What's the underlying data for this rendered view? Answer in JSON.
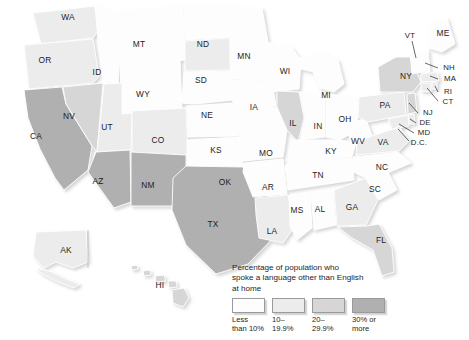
{
  "map": {
    "title": "Percentage of population who spoke a language other than English at home",
    "projection_note": "United States choropleth with Alaska and Hawaii insets",
    "background_color": "#ffffff",
    "border_color": "#ffffff",
    "label_color": "#1d1d1d"
  },
  "legend": {
    "title_line_1": "Percentage of population who",
    "title_line_2": "spoke a language other than English",
    "title_line_3": "at home",
    "title_text": "Percentage of population who\nspoke a language other than English\nat home",
    "items": [
      {
        "label_line_1": "Less",
        "label_line_2": "than 10%",
        "label": "Less\nthan 10%",
        "color": "#fdfdfd"
      },
      {
        "label_line_1": "10–",
        "label_line_2": "19.9%",
        "label": "10–\n19.9%",
        "color": "#ececec"
      },
      {
        "label_line_1": "20–",
        "label_line_2": "29.9%",
        "label": "20–\n29.9%",
        "color": "#d6d6d6"
      },
      {
        "label_line_1": "30% or",
        "label_line_2": "more",
        "label": "30% or\nmore",
        "color": "#b0b0b0"
      }
    ]
  },
  "chart_data": {
    "type": "map",
    "title": "Percentage of population who spoke a language other than English at home",
    "classes": [
      "Less than 10%",
      "10–19.9%",
      "20–29.9%",
      "30% or more"
    ],
    "class_colors": [
      "#fdfdfd",
      "#ececec",
      "#d6d6d6",
      "#b0b0b0"
    ],
    "states": [
      {
        "code": "WA",
        "class": "10–19.9%",
        "color": "#ececec",
        "label_x": 68,
        "label_y": 18
      },
      {
        "code": "OR",
        "class": "10–19.9%",
        "color": "#ececec",
        "label_x": 45,
        "label_y": 61
      },
      {
        "code": "CA",
        "class": "30% or more",
        "color": "#b0b0b0",
        "label_x": 36,
        "label_y": 137
      },
      {
        "code": "NV",
        "class": "20–29.9%",
        "color": "#d6d6d6",
        "label_x": 69,
        "label_y": 117
      },
      {
        "code": "ID",
        "class": "Less than 10%",
        "color": "#fdfdfd",
        "label_x": 97,
        "label_y": 73
      },
      {
        "code": "MT",
        "class": "Less than 10%",
        "color": "#fdfdfd",
        "label_x": 139,
        "label_y": 45
      },
      {
        "code": "WY",
        "class": "Less than 10%",
        "color": "#fdfdfd",
        "label_x": 143,
        "label_y": 95
      },
      {
        "code": "UT",
        "class": "10–19.9%",
        "color": "#ececec",
        "label_x": 107,
        "label_y": 128
      },
      {
        "code": "AZ",
        "class": "30% or more",
        "color": "#b0b0b0",
        "label_x": 98,
        "label_y": 182
      },
      {
        "code": "NM",
        "class": "30% or more",
        "color": "#b0b0b0",
        "label_x": 148,
        "label_y": 186
      },
      {
        "code": "CO",
        "class": "10–19.9%",
        "color": "#ececec",
        "label_x": 158,
        "label_y": 141
      },
      {
        "code": "ND",
        "class": "Less than 10%",
        "color": "#fdfdfd",
        "label_x": 203,
        "label_y": 45
      },
      {
        "code": "SD",
        "class": "10–19.9%",
        "color": "#ececec",
        "label_x": 201,
        "label_y": 81
      },
      {
        "code": "NE",
        "class": "Less than 10%",
        "color": "#fdfdfd",
        "label_x": 207,
        "label_y": 116
      },
      {
        "code": "KS",
        "class": "Less than 10%",
        "color": "#fdfdfd",
        "label_x": 216,
        "label_y": 151
      },
      {
        "code": "OK",
        "class": "Less than 10%",
        "color": "#fdfdfd",
        "label_x": 225,
        "label_y": 183
      },
      {
        "code": "TX",
        "class": "30% or more",
        "color": "#b0b0b0",
        "label_x": 213,
        "label_y": 225
      },
      {
        "code": "MN",
        "class": "Less than 10%",
        "color": "#fdfdfd",
        "label_x": 244,
        "label_y": 57
      },
      {
        "code": "IA",
        "class": "Less than 10%",
        "color": "#fdfdfd",
        "label_x": 254,
        "label_y": 108
      },
      {
        "code": "MO",
        "class": "Less than 10%",
        "color": "#fdfdfd",
        "label_x": 266,
        "label_y": 154
      },
      {
        "code": "AR",
        "class": "Less than 10%",
        "color": "#fdfdfd",
        "label_x": 268,
        "label_y": 188
      },
      {
        "code": "LA",
        "class": "10–19.9%",
        "color": "#ececec",
        "label_x": 272,
        "label_y": 232
      },
      {
        "code": "WI",
        "class": "Less than 10%",
        "color": "#fdfdfd",
        "label_x": 285,
        "label_y": 72
      },
      {
        "code": "IL",
        "class": "20–29.9%",
        "color": "#d6d6d6",
        "label_x": 293,
        "label_y": 124
      },
      {
        "code": "MS",
        "class": "Less than 10%",
        "color": "#fdfdfd",
        "label_x": 297,
        "label_y": 211
      },
      {
        "code": "AL",
        "class": "Less than 10%",
        "color": "#fdfdfd",
        "label_x": 320,
        "label_y": 210
      },
      {
        "code": "TN",
        "class": "Less than 10%",
        "color": "#fdfdfd",
        "label_x": 318,
        "label_y": 176
      },
      {
        "code": "KY",
        "class": "Less than 10%",
        "color": "#fdfdfd",
        "label_x": 331,
        "label_y": 152
      },
      {
        "code": "IN",
        "class": "Less than 10%",
        "color": "#fdfdfd",
        "label_x": 318,
        "label_y": 127
      },
      {
        "code": "OH",
        "class": "Less than 10%",
        "color": "#fdfdfd",
        "label_x": 345,
        "label_y": 120
      },
      {
        "code": "MI",
        "class": "Less than 10%",
        "color": "#fdfdfd",
        "label_x": 326,
        "label_y": 96
      },
      {
        "code": "GA",
        "class": "10–19.9%",
        "color": "#ececec",
        "label_x": 352,
        "label_y": 208
      },
      {
        "code": "FL",
        "class": "20–29.9%",
        "color": "#d6d6d6",
        "label_x": 381,
        "label_y": 241
      },
      {
        "code": "SC",
        "class": "Less than 10%",
        "color": "#fdfdfd",
        "label_x": 375,
        "label_y": 190
      },
      {
        "code": "NC",
        "class": "Less than 10%",
        "color": "#fdfdfd",
        "label_x": 382,
        "label_y": 168
      },
      {
        "code": "WV",
        "class": "Less than 10%",
        "color": "#fdfdfd",
        "label_x": 358,
        "label_y": 142
      },
      {
        "code": "VA",
        "class": "10–19.9%",
        "color": "#ececec",
        "label_x": 383,
        "label_y": 143
      },
      {
        "code": "PA",
        "class": "10–19.9%",
        "color": "#ececec",
        "label_x": 385,
        "label_y": 106
      },
      {
        "code": "NY",
        "class": "20–29.9%",
        "color": "#d6d6d6",
        "label_x": 406,
        "label_y": 77
      },
      {
        "code": "VT",
        "class": "Less than 10%",
        "color": "#fdfdfd",
        "label_x": 410,
        "label_y": 36
      },
      {
        "code": "ME",
        "class": "Less than 10%",
        "color": "#fdfdfd",
        "label_x": 443,
        "label_y": 34
      },
      {
        "code": "NH",
        "class": "Less than 10%",
        "color": "#fdfdfd",
        "label_x": 449,
        "label_y": 68
      },
      {
        "code": "MA",
        "class": "10–19.9%",
        "color": "#ececec",
        "label_x": 450,
        "label_y": 79
      },
      {
        "code": "RI",
        "class": "10–19.9%",
        "color": "#ececec",
        "label_x": 448,
        "label_y": 92
      },
      {
        "code": "CT",
        "class": "10–19.9%",
        "color": "#ececec",
        "label_x": 448,
        "label_y": 102
      },
      {
        "code": "NJ",
        "class": "20–29.9%",
        "color": "#d6d6d6",
        "label_x": 428,
        "label_y": 113
      },
      {
        "code": "DE",
        "class": "10–19.9%",
        "color": "#ececec",
        "label_x": 425,
        "label_y": 123
      },
      {
        "code": "MD",
        "class": "10–19.9%",
        "color": "#ececec",
        "label_x": 424,
        "label_y": 133
      },
      {
        "code": "D.C.",
        "class": "10–19.9%",
        "color": "#ececec",
        "label_x": 419,
        "label_y": 143
      },
      {
        "code": "AK",
        "class": "10–19.9%",
        "color": "#ececec",
        "label_x": 66,
        "label_y": 251
      },
      {
        "code": "HI",
        "class": "20–29.9%",
        "color": "#d6d6d6",
        "label_x": 160,
        "label_y": 286
      }
    ]
  }
}
